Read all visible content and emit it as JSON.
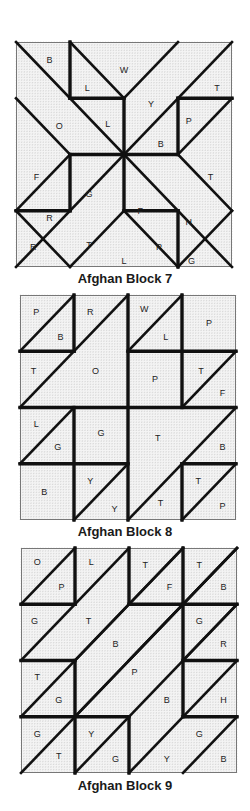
{
  "colors": {
    "ink": "#111111",
    "grid": "#b8b8b8",
    "paper": "#f4f4f4"
  },
  "blocks": [
    {
      "id": "block7",
      "caption": "Afghan Block 7",
      "box": {
        "x": 16,
        "y": 42,
        "w": 216,
        "h": 225
      },
      "caption_y": 273,
      "thin_lines": [
        [
          0,
          0,
          4,
          4
        ],
        [
          1,
          0,
          2,
          1
        ],
        [
          0,
          1,
          1,
          2
        ],
        [
          3,
          4,
          4,
          3
        ],
        [
          4,
          0,
          0,
          4
        ],
        [
          3,
          0,
          2,
          1
        ],
        [
          4,
          1,
          3,
          2
        ],
        [
          0,
          3,
          1,
          2
        ],
        [
          1,
          4,
          2,
          3
        ],
        [
          2,
          3,
          3,
          4
        ],
        [
          3,
          2,
          4,
          3
        ],
        [
          0,
          3,
          1,
          4
        ]
      ],
      "thick_lines": [
        [
          1,
          0,
          1,
          1
        ],
        [
          1,
          1,
          2,
          1
        ],
        [
          2,
          1,
          2,
          2
        ],
        [
          3,
          1,
          4,
          1
        ],
        [
          3,
          1,
          3,
          2
        ],
        [
          3,
          2,
          2,
          2
        ],
        [
          0,
          3,
          1,
          3
        ],
        [
          1,
          3,
          1,
          2
        ],
        [
          1,
          2,
          2,
          2
        ],
        [
          2,
          2,
          2,
          3
        ],
        [
          2,
          3,
          3,
          3
        ],
        [
          3,
          3,
          3,
          4
        ]
      ],
      "labels": [
        {
          "t": "B",
          "x": 0.62,
          "y": 0.32
        },
        {
          "t": "W",
          "x": 2.0,
          "y": 0.5
        },
        {
          "t": "L",
          "x": 1.32,
          "y": 0.82
        },
        {
          "t": "T",
          "x": 3.72,
          "y": 0.82
        },
        {
          "t": "Y",
          "x": 2.5,
          "y": 1.1
        },
        {
          "t": "O",
          "x": 0.8,
          "y": 1.5
        },
        {
          "t": "L",
          "x": 1.7,
          "y": 1.45
        },
        {
          "t": "P",
          "x": 3.2,
          "y": 1.4
        },
        {
          "t": "B",
          "x": 2.68,
          "y": 1.82
        },
        {
          "t": "F",
          "x": 0.38,
          "y": 2.4
        },
        {
          "t": "T",
          "x": 3.6,
          "y": 2.4
        },
        {
          "t": "G",
          "x": 1.35,
          "y": 2.7
        },
        {
          "t": "R",
          "x": 0.62,
          "y": 3.12
        },
        {
          "t": "F",
          "x": 2.3,
          "y": 3.0
        },
        {
          "t": "H",
          "x": 3.2,
          "y": 3.2
        },
        {
          "t": "R",
          "x": 0.32,
          "y": 3.65
        },
        {
          "t": "T",
          "x": 1.35,
          "y": 3.6
        },
        {
          "t": "P",
          "x": 2.65,
          "y": 3.65
        },
        {
          "t": "L",
          "x": 2.0,
          "y": 3.9
        },
        {
          "t": "G",
          "x": 3.25,
          "y": 3.9
        }
      ]
    },
    {
      "id": "block8",
      "caption": "Afghan Block 8",
      "box": {
        "x": 20,
        "y": 295,
        "w": 216,
        "h": 225
      },
      "caption_y": 526,
      "thin_lines": [
        [
          0,
          1,
          1,
          0
        ],
        [
          0,
          2,
          2,
          0
        ],
        [
          2,
          1,
          3,
          0
        ],
        [
          3,
          2,
          4,
          1
        ],
        [
          0,
          3,
          1,
          2
        ],
        [
          2,
          4,
          4,
          2
        ],
        [
          1,
          4,
          2,
          3
        ],
        [
          3,
          4,
          4,
          3
        ]
      ],
      "thick_lines": [
        [
          1,
          0,
          1,
          1
        ],
        [
          0,
          1,
          1,
          1
        ],
        [
          2,
          0,
          2,
          4
        ],
        [
          2,
          1,
          4,
          1
        ],
        [
          3,
          0,
          3,
          2
        ],
        [
          0,
          2,
          4,
          2
        ],
        [
          1,
          2,
          1,
          4
        ],
        [
          0,
          3,
          2,
          3
        ],
        [
          3,
          3,
          4,
          3
        ],
        [
          3,
          3,
          3,
          4
        ]
      ],
      "labels": [
        {
          "t": "P",
          "x": 0.3,
          "y": 0.3
        },
        {
          "t": "B",
          "x": 0.75,
          "y": 0.75
        },
        {
          "t": "R",
          "x": 1.3,
          "y": 0.3
        },
        {
          "t": "W",
          "x": 2.3,
          "y": 0.25
        },
        {
          "t": "L",
          "x": 2.7,
          "y": 0.75
        },
        {
          "t": "P",
          "x": 3.5,
          "y": 0.5
        },
        {
          "t": "T",
          "x": 0.25,
          "y": 1.35
        },
        {
          "t": "O",
          "x": 1.4,
          "y": 1.35
        },
        {
          "t": "P",
          "x": 2.5,
          "y": 1.5
        },
        {
          "t": "T",
          "x": 3.35,
          "y": 1.35
        },
        {
          "t": "F",
          "x": 3.75,
          "y": 1.75
        },
        {
          "t": "L",
          "x": 0.3,
          "y": 2.3
        },
        {
          "t": "G",
          "x": 0.7,
          "y": 2.7
        },
        {
          "t": "G",
          "x": 1.5,
          "y": 2.45
        },
        {
          "t": "T",
          "x": 2.55,
          "y": 2.55
        },
        {
          "t": "B",
          "x": 3.75,
          "y": 2.7
        },
        {
          "t": "B",
          "x": 0.45,
          "y": 3.5
        },
        {
          "t": "Y",
          "x": 1.3,
          "y": 3.3
        },
        {
          "t": "Y",
          "x": 1.75,
          "y": 3.8
        },
        {
          "t": "T",
          "x": 2.6,
          "y": 3.7
        },
        {
          "t": "T",
          "x": 3.3,
          "y": 3.3
        },
        {
          "t": "P",
          "x": 3.75,
          "y": 3.75
        }
      ]
    },
    {
      "id": "block9",
      "caption": "Afghan Block 9",
      "box": {
        "x": 21,
        "y": 548,
        "w": 216,
        "h": 225
      },
      "caption_y": 780,
      "thin_lines": [
        [
          0,
          1,
          1,
          0
        ],
        [
          0,
          2,
          2,
          0
        ],
        [
          1,
          2,
          3,
          0
        ],
        [
          2,
          2,
          4,
          0
        ],
        [
          0,
          3,
          3,
          0
        ],
        [
          1,
          3,
          4,
          0
        ],
        [
          3,
          2,
          4,
          1
        ],
        [
          0,
          4,
          4,
          0
        ],
        [
          1,
          4,
          4,
          1
        ],
        [
          2,
          4,
          4,
          2
        ],
        [
          3,
          4,
          4,
          3
        ]
      ],
      "thick_lines": [
        [
          1,
          0,
          1,
          1
        ],
        [
          0,
          1,
          1,
          1
        ],
        [
          2,
          0,
          2,
          1
        ],
        [
          2,
          1,
          3,
          1
        ],
        [
          3,
          0,
          3,
          3
        ],
        [
          3,
          1,
          4,
          1
        ],
        [
          0,
          2,
          1,
          2
        ],
        [
          1,
          2,
          1,
          4
        ],
        [
          3,
          2,
          4,
          2
        ],
        [
          0,
          3,
          2,
          3
        ],
        [
          2,
          3,
          2,
          4
        ],
        [
          3,
          3,
          4,
          3
        ]
      ],
      "labels": [
        {
          "t": "O",
          "x": 0.3,
          "y": 0.25
        },
        {
          "t": "P",
          "x": 0.75,
          "y": 0.7
        },
        {
          "t": "L",
          "x": 1.3,
          "y": 0.25
        },
        {
          "t": "T",
          "x": 2.3,
          "y": 0.3
        },
        {
          "t": "F",
          "x": 2.75,
          "y": 0.7
        },
        {
          "t": "T",
          "x": 3.3,
          "y": 0.3
        },
        {
          "t": "B",
          "x": 3.75,
          "y": 0.7
        },
        {
          "t": "G",
          "x": 0.25,
          "y": 1.3
        },
        {
          "t": "T",
          "x": 1.25,
          "y": 1.3
        },
        {
          "t": "B",
          "x": 1.75,
          "y": 1.7
        },
        {
          "t": "G",
          "x": 3.3,
          "y": 1.3
        },
        {
          "t": "R",
          "x": 3.75,
          "y": 1.7
        },
        {
          "t": "T",
          "x": 0.3,
          "y": 2.3
        },
        {
          "t": "G",
          "x": 0.7,
          "y": 2.7
        },
        {
          "t": "P",
          "x": 2.1,
          "y": 2.2
        },
        {
          "t": "B",
          "x": 2.7,
          "y": 2.7
        },
        {
          "t": "H",
          "x": 3.75,
          "y": 2.7
        },
        {
          "t": "G",
          "x": 0.3,
          "y": 3.3
        },
        {
          "t": "T",
          "x": 0.7,
          "y": 3.7
        },
        {
          "t": "Y",
          "x": 1.3,
          "y": 3.3
        },
        {
          "t": "G",
          "x": 1.75,
          "y": 3.75
        },
        {
          "t": "Y",
          "x": 2.7,
          "y": 3.75
        },
        {
          "t": "G",
          "x": 3.3,
          "y": 3.3
        },
        {
          "t": "B",
          "x": 3.75,
          "y": 3.75
        }
      ]
    }
  ]
}
